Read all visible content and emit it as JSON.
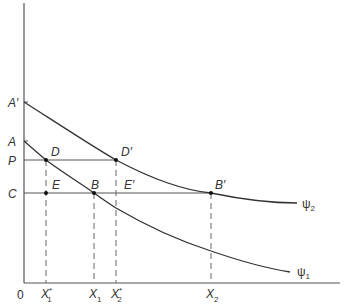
{
  "diagram": {
    "colors": {
      "axis": "#555555",
      "curve": "#333333",
      "guide": "#555555",
      "dashed": "#666666",
      "point": "#111111",
      "text": "#333333"
    },
    "axes": {
      "origin_label": "0"
    },
    "y_labels": {
      "a_prime": "A′",
      "a": "A",
      "p": "P",
      "c": "C"
    },
    "x_labels": {
      "x1_star": {
        "base": "X",
        "sup": "*",
        "sub": "1"
      },
      "x1": {
        "base": "X",
        "sub": "1"
      },
      "x2_star": {
        "base": "X",
        "sup": "*",
        "sub": "2"
      },
      "x2": {
        "base": "X",
        "sub": "2"
      }
    },
    "point_labels": {
      "d": "D",
      "d_prime": "D′",
      "e": "E",
      "b": "B",
      "e_prime": "E′",
      "b_prime": "B′"
    },
    "curves": {
      "psi1": {
        "base": "ψ",
        "sub": "1"
      },
      "psi2": {
        "base": "ψ",
        "sub": "2"
      }
    }
  }
}
